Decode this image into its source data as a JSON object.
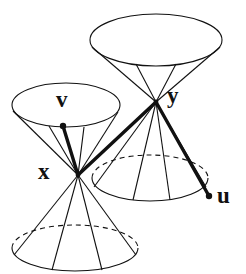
{
  "figure": {
    "width": 246,
    "height": 274,
    "background_color": "#ffffff",
    "stroke_color": "#111111",
    "thin_stroke_width": 1.1,
    "thick_stroke_width": 3.4,
    "dash_pattern": "5,4"
  },
  "labels": {
    "x": "x",
    "y": "y",
    "v": "v",
    "u": "u"
  },
  "points": {
    "x_apex": {
      "cx": 78,
      "cy": 175
    },
    "y_apex": {
      "cx": 156,
      "cy": 102
    },
    "v_tip": {
      "cx": 63,
      "cy": 126,
      "dot_r": 3.2
    },
    "u_tip": {
      "cx": 209,
      "cy": 196,
      "dot_r": 3.2
    }
  },
  "cones": [
    {
      "name": "upper-cone-of-y",
      "apex": {
        "x": 156,
        "y": 102
      },
      "rim": {
        "cx": 156,
        "cy": 40,
        "rx": 66,
        "ry": 26
      },
      "front_arc_visible": true,
      "back_arc_dashed": false,
      "rulings": [
        -0.82,
        -0.3,
        0.3,
        0.82
      ]
    },
    {
      "name": "lower-cone-of-y",
      "apex": {
        "x": 156,
        "y": 102
      },
      "rim": {
        "cx": 150,
        "cy": 178,
        "rx": 58,
        "ry": 23
      },
      "front_arc_visible": true,
      "back_arc_dashed": true,
      "rulings": [
        -0.8,
        -0.28,
        0.28,
        0.8
      ]
    },
    {
      "name": "upper-cone-of-x",
      "apex": {
        "x": 78,
        "y": 175
      },
      "rim": {
        "cx": 66,
        "cy": 105,
        "rx": 54,
        "ry": 22
      },
      "front_arc_visible": true,
      "back_arc_dashed": false,
      "rulings": [
        -0.84,
        -0.32,
        0.32,
        0.84
      ]
    },
    {
      "name": "lower-cone-of-x",
      "apex": {
        "x": 78,
        "y": 175
      },
      "rim": {
        "cx": 75,
        "cy": 248,
        "rx": 63,
        "ry": 23
      },
      "front_arc_visible": true,
      "back_arc_dashed": true,
      "rulings": [
        -0.82,
        -0.3,
        0.3,
        0.82
      ]
    }
  ],
  "vectors": [
    {
      "name": "segment-x-to-y",
      "from": {
        "x": 78,
        "y": 175
      },
      "to": {
        "x": 156,
        "y": 102
      },
      "weight": "thick"
    },
    {
      "name": "vector-v-from-x",
      "from": {
        "x": 78,
        "y": 175
      },
      "to": {
        "x": 63,
        "y": 126
      },
      "weight": "thick"
    },
    {
      "name": "vector-u-from-y",
      "from": {
        "x": 156,
        "y": 102
      },
      "to": {
        "x": 209,
        "y": 196
      },
      "weight": "thick"
    }
  ]
}
